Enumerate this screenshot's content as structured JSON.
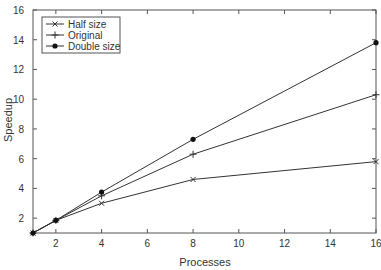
{
  "chart_data": {
    "type": "line",
    "title": "",
    "xlabel": "Processes",
    "ylabel": "Speedup",
    "xlim": [
      1,
      16
    ],
    "ylim": [
      1,
      16
    ],
    "x_ticks": [
      2,
      4,
      6,
      8,
      10,
      12,
      14,
      16
    ],
    "y_ticks": [
      2,
      4,
      6,
      8,
      10,
      12,
      14,
      16
    ],
    "grid": false,
    "legend_position": "upper left",
    "x": [
      1,
      2,
      4,
      8,
      16
    ],
    "series": [
      {
        "name": "Half size",
        "marker": "x",
        "values": [
          1,
          1.85,
          3.0,
          4.6,
          5.8
        ]
      },
      {
        "name": "Original",
        "marker": "+",
        "values": [
          1,
          1.85,
          3.5,
          6.3,
          10.3
        ]
      },
      {
        "name": "Double size",
        "marker": "dot",
        "values": [
          1,
          1.85,
          3.75,
          7.3,
          13.8
        ]
      }
    ]
  },
  "colors": {
    "line": "#333333",
    "axis": "#555555",
    "text": "#333333"
  }
}
